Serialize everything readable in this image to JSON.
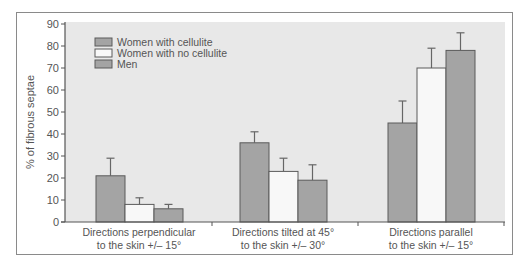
{
  "chart_data": {
    "type": "bar",
    "title": "",
    "xlabel": "",
    "ylabel": "% of fibrous septae",
    "ylim": [
      0,
      90
    ],
    "yticks": [
      0,
      10,
      20,
      30,
      40,
      50,
      60,
      70,
      80,
      90
    ],
    "grid": false,
    "legend_position": "upper-left",
    "categories": [
      [
        "Directions perpendicular",
        "to the skin +/– 15°"
      ],
      [
        "Directions tilted at 45°",
        "to the skin +/– 30°"
      ],
      [
        "Directions parallel",
        "to the skin +/– 15°"
      ]
    ],
    "series": [
      {
        "name": "Women with cellulite",
        "color": "#a4a4a4",
        "values": [
          21,
          36,
          45
        ],
        "error_upper": [
          29,
          41,
          55
        ]
      },
      {
        "name": "Women with no cellulite",
        "color": "#f8f8f8",
        "values": [
          8,
          23,
          70
        ],
        "error_upper": [
          11,
          29,
          79
        ]
      },
      {
        "name": "Men",
        "color": "#a4a4a4",
        "values": [
          6,
          19,
          78
        ],
        "error_upper": [
          8,
          26,
          86
        ]
      }
    ],
    "colors": {
      "plot_background": "#e8e8e8",
      "axis": "#555555",
      "bar_edge": "#5a5a5a",
      "frame": "#8a8a8a"
    }
  }
}
